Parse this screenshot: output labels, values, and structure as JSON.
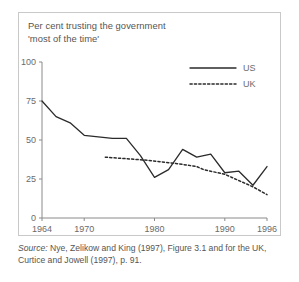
{
  "figure": {
    "title_line1": "Per cent trusting the government",
    "title_line2": "'most of the time'",
    "source_prefix": "Source:",
    "source_line1": "Nye, Zelikow and King (1997), Figure 3.1 and for the UK,",
    "source_line2": "Curtice and Jowell (1997), p. 91.",
    "border_color": "#c9c9c9",
    "line_color": "#2b2b2b",
    "axis_color": "#8a8a8a",
    "text_color": "#555555"
  },
  "chart_data": {
    "type": "line",
    "title": "Per cent trusting the government 'most of the time'",
    "xlabel": "",
    "ylabel": "",
    "xlim": [
      1964,
      1996
    ],
    "ylim": [
      0,
      100
    ],
    "yticks": [
      0,
      25,
      50,
      75,
      100
    ],
    "ytick_labels": [
      "0",
      "25",
      "50",
      "75",
      "100"
    ],
    "xticks": [
      1964,
      1970,
      1980,
      1990,
      1996
    ],
    "xtick_labels": [
      "1964",
      "1970",
      "1980",
      "1990",
      "1996"
    ],
    "grid": false,
    "legend_position": "top-right",
    "series": [
      {
        "name": "US",
        "style": "solid",
        "x": [
          1964,
          1966,
          1968,
          1970,
          1972,
          1974,
          1976,
          1978,
          1980,
          1982,
          1984,
          1986,
          1988,
          1990,
          1992,
          1994,
          1996
        ],
        "values": [
          75,
          65,
          61,
          53,
          52,
          51,
          51,
          40,
          26,
          31,
          44,
          39,
          41,
          29,
          30,
          21,
          33
        ]
      },
      {
        "name": "UK",
        "style": "dotted",
        "x": [
          1973,
          1976,
          1979,
          1983,
          1986,
          1987,
          1990,
          1991,
          1994,
          1996
        ],
        "values": [
          39,
          38,
          37,
          35,
          33,
          31,
          28,
          26,
          20,
          15
        ]
      }
    ]
  }
}
